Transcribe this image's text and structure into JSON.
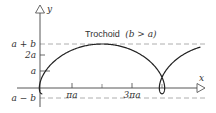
{
  "diagram": {
    "title": "Trochoid",
    "condition": "(b > a)",
    "axes": {
      "x_label": "x",
      "y_label": "y"
    },
    "y_ticks": [
      {
        "label": "a + b",
        "value": "a+b"
      },
      {
        "label": "2a",
        "value": "2a"
      },
      {
        "label": "a",
        "value": "a"
      },
      {
        "label": "a − b",
        "value": "a-b"
      }
    ],
    "x_ticks": [
      {
        "label": "πa",
        "value": "pi*a"
      },
      {
        "label": "3πa",
        "value": "3*pi*a"
      }
    ],
    "curve": {
      "type": "trochoid",
      "equations": [
        "x = aθ − b sin θ",
        "y = a − b cos θ"
      ],
      "ratio_b_over_a": 1.6
    },
    "colors": {
      "curve": "#222222",
      "axis": "#444444",
      "dashed": "#888888",
      "text": "#333333"
    }
  }
}
